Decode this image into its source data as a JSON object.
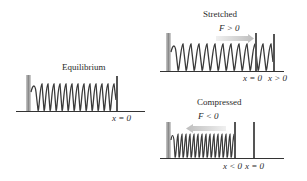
{
  "panels": {
    "equilibrium": {
      "title": "Equilibrium",
      "position_label": "x = 0"
    },
    "stretched": {
      "title": "Stretched",
      "force_label": "F > 0",
      "ref_label": "x = 0",
      "position_label": "x > 0",
      "arrow_direction": "right"
    },
    "compressed": {
      "title": "Compressed",
      "force_label": "F < 0",
      "position_label": "x < 0",
      "ref_label": "x = 0",
      "arrow_direction": "left"
    }
  },
  "colors": {
    "wall": "#9a9a9a",
    "spring": "#3a3a3a",
    "rod": "#555555",
    "arrow": "#c8c8c8",
    "floor": "#333333"
  }
}
